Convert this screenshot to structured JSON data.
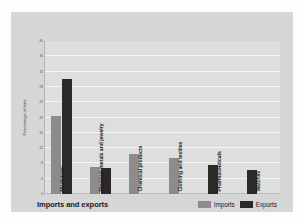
{
  "chart_data": {
    "type": "bar",
    "title": "Imports and exports",
    "xlabel": "",
    "ylabel": "Percentage of total",
    "ylim": [
      0,
      40
    ],
    "yticks": [
      0,
      4,
      8,
      12,
      16,
      20,
      24,
      28,
      32,
      36,
      40
    ],
    "grid": true,
    "legend_position": "bottom-right",
    "categories": [
      "Machinery",
      "Precious metals and jewelry",
      "Chemical products",
      "Clothing and textiles",
      "Pharmaceuticals",
      "Watches"
    ],
    "series": [
      {
        "name": "Imports",
        "color": "#8c8c8c",
        "values": [
          20.5,
          7.0,
          10.5,
          9.5,
          0,
          0
        ]
      },
      {
        "name": "Exports",
        "color": "#2a2a2a",
        "values": [
          30.0,
          6.8,
          0,
          0,
          7.5,
          6.3
        ]
      }
    ]
  },
  "legend": {
    "items": [
      {
        "label": "Imports",
        "color": "#8c8c8c"
      },
      {
        "label": "Exports",
        "color": "#2a2a2a"
      }
    ]
  },
  "colors": {
    "page_background": "#fdfdfd",
    "panel_background": "#d6d6d6",
    "plot_background": "#dedede",
    "gridline": "#f4f4f4",
    "axis": "#b4b4b4",
    "imports": "#8c8c8c",
    "exports": "#2a2a2a",
    "text": "#1b1b1b"
  }
}
